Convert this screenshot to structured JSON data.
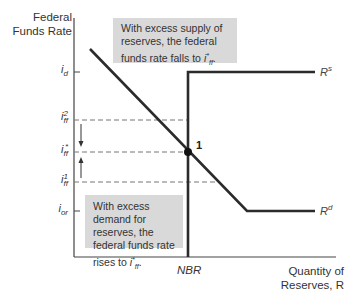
{
  "axes": {
    "y_label_line1": "Federal",
    "y_label_line2": "Funds Rate",
    "x_label_line1": "Quantity of",
    "x_label_line2": "Reserves, R"
  },
  "y_ticks": [
    {
      "id": "i_d",
      "base": "i",
      "sub": "d",
      "sup": ""
    },
    {
      "id": "i_ff2",
      "base": "i",
      "sub": "ff",
      "sup": "2"
    },
    {
      "id": "i_ff_star",
      "base": "i",
      "sub": "ff",
      "sup": "*"
    },
    {
      "id": "i_ff1",
      "base": "i",
      "sub": "ff",
      "sup": "1"
    },
    {
      "id": "i_or",
      "base": "i",
      "sub": "or",
      "sup": ""
    }
  ],
  "x_ticks": [
    {
      "id": "NBR",
      "label": "NBR"
    }
  ],
  "curves": {
    "supply": {
      "base": "R",
      "sup": "s"
    },
    "demand": {
      "base": "R",
      "sup": "d"
    }
  },
  "equilibrium": {
    "label": "1"
  },
  "notes": {
    "top": {
      "text": "With excess supply of reserves, the federal funds rate falls to ",
      "var_base": "i",
      "var_sub": "ff",
      "var_sup": "*",
      "suffix": "."
    },
    "bottom": {
      "text": "With excess demand for reserves, the federal funds rate rises to ",
      "var_base": "i",
      "var_sub": "ff",
      "var_sup": "*",
      "suffix": "."
    }
  },
  "colors": {
    "line": "#2b2b2b",
    "dashed": "#777777",
    "note_bg": "#d9d9d9",
    "axis": "#444444"
  }
}
